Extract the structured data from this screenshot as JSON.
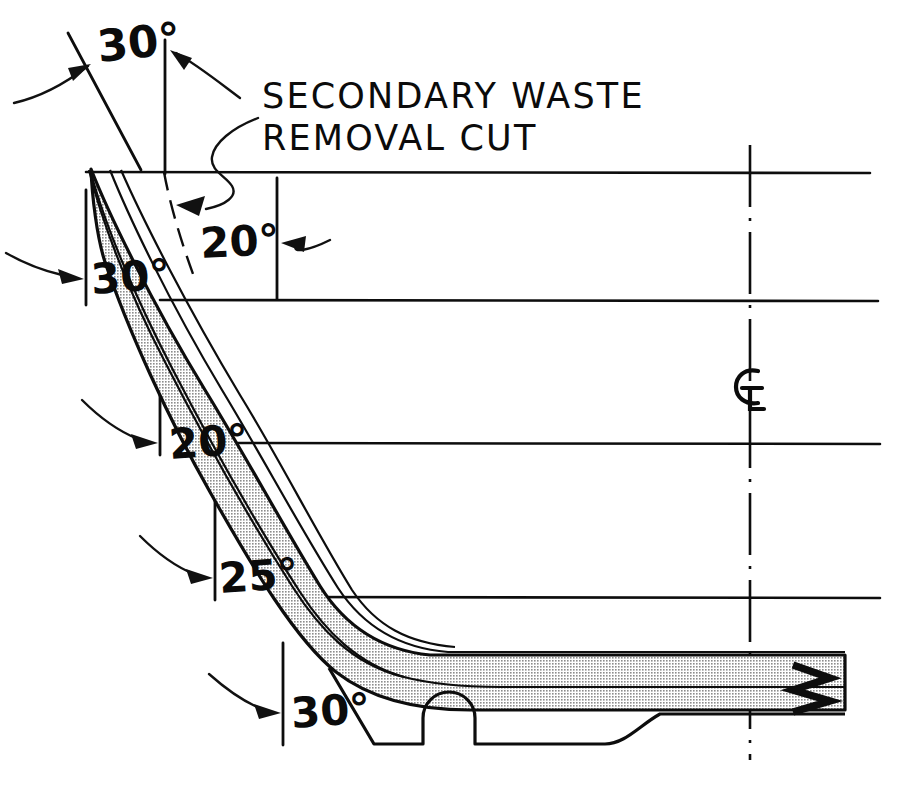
{
  "drawing": {
    "title": "Airfoil section machining setup drawing",
    "background_color": "#ffffff",
    "line_color": "#0d0d0d",
    "shade_fill_color": "#c9c9c9",
    "note": {
      "line1": "SECONDARY WASTE",
      "line2": "REMOVAL CUT"
    },
    "centerline_symbol": "CL",
    "annotations": [
      {
        "id": "angle-top-30",
        "label": "30°",
        "x": 99,
        "y": 62
      },
      {
        "id": "angle-20-upper",
        "label": "20°",
        "x": 201,
        "y": 251
      },
      {
        "id": "angle-30-upper-left",
        "label": "30°",
        "x": 92,
        "y": 288
      },
      {
        "id": "angle-20-mid",
        "label": "20°",
        "x": 172,
        "y": 447
      },
      {
        "id": "angle-25-lower",
        "label": "25°",
        "x": 220,
        "y": 578
      },
      {
        "id": "angle-30-bottom",
        "label": "30°",
        "x": 294,
        "y": 713
      }
    ],
    "reference_lines": {
      "horizontal_y": [
        172,
        300,
        443,
        597
      ],
      "horizontal_x_start": [
        86,
        160,
        218,
        281
      ],
      "horizontal_x_end": [
        870,
        878,
        880,
        880
      ]
    },
    "centerline_x": 750,
    "break_symbol": "zigzag-break"
  }
}
